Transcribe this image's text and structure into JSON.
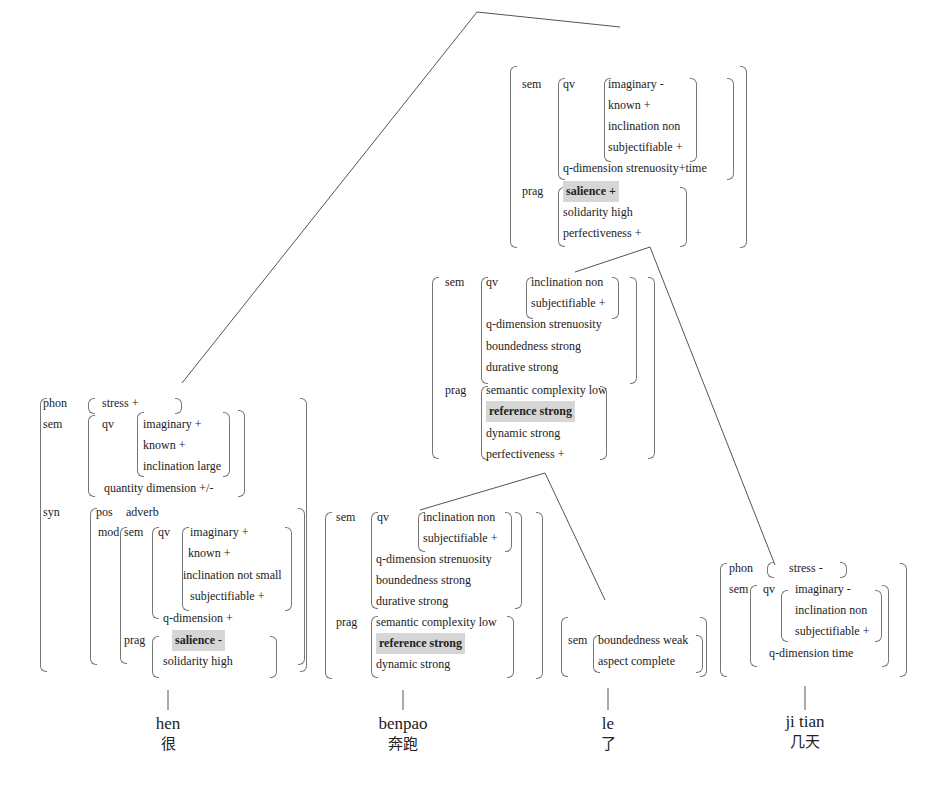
{
  "tree": {
    "root": {
      "sem_label": "sem",
      "qv_label": "qv",
      "qv": [
        "imaginary -",
        "known +",
        "inclination non",
        "subjectifiable +"
      ],
      "qdim": "q-dimension strenuosity+time",
      "prag_label": "prag",
      "prag": [
        {
          "text": "salience   +",
          "highlight": true
        },
        {
          "text": "solidarity   high"
        },
        {
          "text": "perfectiveness +"
        }
      ]
    },
    "vp": {
      "sem_label": "sem",
      "qv_label": "qv",
      "qv": [
        "inclination non",
        "subjectifiable +"
      ],
      "sem_rest": [
        "q-dimension strenuosity",
        "boundedness strong",
        "durative strong"
      ],
      "prag_label": "prag",
      "prag": [
        "semantic complexity low",
        "reference strong",
        "dynamic strong",
        "perfectiveness +"
      ]
    },
    "hen": {
      "phon_label": "phon",
      "phon": "stress +",
      "sem_label": "sem",
      "qv_label": "qv",
      "qv": [
        "imaginary +",
        "known +",
        "inclination large"
      ],
      "qdim": "quantity dimension +/-",
      "syn_label": "syn",
      "pos_label": "pos",
      "pos": "adverb",
      "mod_label": "mod",
      "mod_sem_label": "sem",
      "mod_qv_label": "qv",
      "mod_qv": [
        "imaginary +",
        "known +",
        "inclination not small",
        "subjectifiable +"
      ],
      "mod_qdim": "q-dimension +",
      "mod_prag_label": "prag",
      "mod_prag": [
        "salience   -",
        "solidarity   high"
      ]
    },
    "benpao": {
      "sem_label": "sem",
      "qv_label": "qv",
      "qv": [
        "inclination non",
        "subjectifiable +"
      ],
      "sem_rest": [
        "q-dimension strenuosity",
        "boundedness strong",
        "durative strong"
      ],
      "prag_label": "prag",
      "prag": [
        "semantic complexity low",
        "reference strong",
        "dynamic strong"
      ]
    },
    "le": {
      "sem_label": "sem",
      "sem": [
        "boundedness weak",
        "aspect   complete"
      ]
    },
    "jitian": {
      "phon_label": "phon",
      "phon": "stress -",
      "sem_label": "sem",
      "qv_label": "qv",
      "qv": [
        "imaginary -",
        "inclination non",
        "subjectifiable +"
      ],
      "qdim": "q-dimension time"
    }
  },
  "words": [
    {
      "pinyin": "hen",
      "hanzi": "很"
    },
    {
      "pinyin": "benpao",
      "hanzi": "奔跑"
    },
    {
      "pinyin": "le",
      "hanzi": "了"
    },
    {
      "pinyin": "ji tian",
      "hanzi": "几天"
    }
  ],
  "colors": {
    "line": "#555555",
    "highlight": "#d6d6d6",
    "text": "#222222"
  }
}
